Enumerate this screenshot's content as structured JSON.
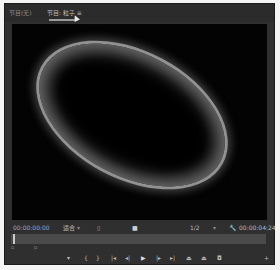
{
  "tabs": [
    {
      "label": "节目(无)"
    },
    {
      "label": "节目: 粒子 ≡"
    }
  ],
  "controls": {
    "current_timecode": "00:00:00:00",
    "fit_label": "适合",
    "fit_arrow": "▾",
    "resolution_label": "1/2",
    "resolution_arrow": "▾",
    "duration_timecode": "00:00:04:24"
  },
  "transport": {
    "add_marker": "▾",
    "mark_in": "{",
    "mark_out": "}",
    "go_to_in": "|◂",
    "step_back": "◂|",
    "play": "▶",
    "step_forward": "|▸",
    "go_to_out": "▸|",
    "lift": "⏏",
    "extract": "⏏",
    "export_frame": "◘",
    "add_button": "+"
  }
}
